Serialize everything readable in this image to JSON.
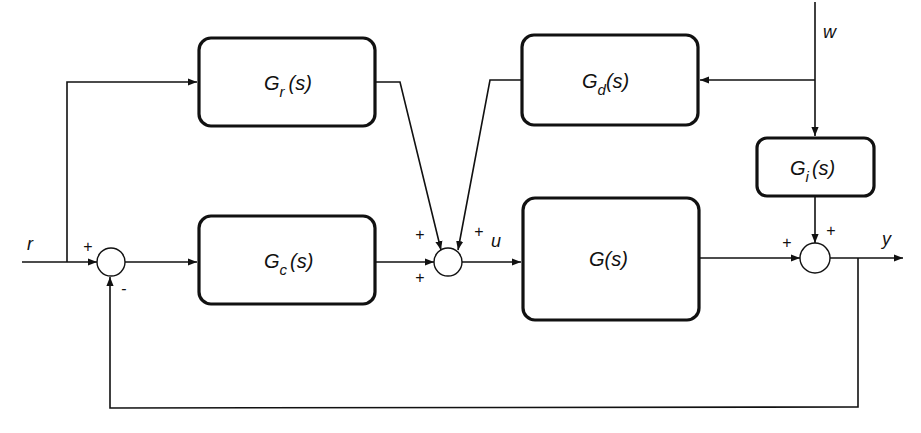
{
  "diagram": {
    "type": "control-system block diagram",
    "blocks": {
      "Gr": {
        "base": "G",
        "sub": "r",
        "arg": "(s)"
      },
      "Gd": {
        "base": "G",
        "sub": "d",
        "arg": "(s)"
      },
      "Gi": {
        "base": "G",
        "sub": "i",
        "arg": "(s)"
      },
      "Gc": {
        "base": "G",
        "sub": "c",
        "arg": "(s)"
      },
      "G": {
        "label": "G(s)"
      }
    },
    "signals": {
      "r": "r",
      "u": "u",
      "w": "w",
      "y": "y"
    },
    "signs": {
      "s1_top": "+",
      "s1_bottom": "-",
      "s2_left_top": "+",
      "s2_right_top": "+",
      "s2_left_bottom": "+",
      "s3_left": "+",
      "s3_top": "+"
    }
  }
}
